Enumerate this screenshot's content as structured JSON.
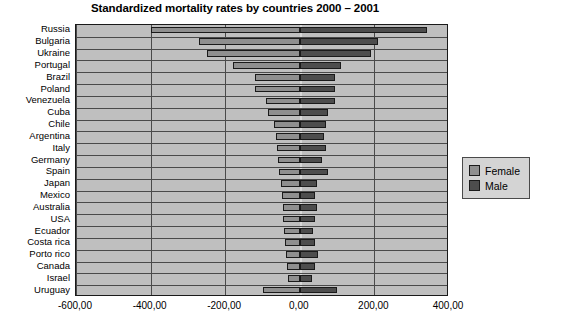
{
  "chart_data": {
    "type": "bar",
    "orientation": "horizontal",
    "style": "diverging-butterfly",
    "title": "Standardized mortality rates by countries 2000 – 2001",
    "xlabel": "",
    "ylabel": "",
    "xlim": [
      -600.0,
      400.0
    ],
    "xticks": [
      -600.0,
      -400.0,
      -200.0,
      0.0,
      200.0,
      400.0
    ],
    "xticklabels": [
      "-600,00",
      "-400,00",
      "-200,00",
      "0,00",
      "200,00",
      "400,00"
    ],
    "grid": true,
    "legend_position": "right-outside",
    "note": "Female values are plotted to the left of zero (negative direction); Male values to the right (positive).",
    "categories": [
      "Russia",
      "Bulgaria",
      "Ukraine",
      "Portugal",
      "Brazil",
      "Poland",
      "Venezuela",
      "Cuba",
      "Chile",
      "Argentina",
      "Italy",
      "Germany",
      "Spain",
      "Japan",
      "Mexico",
      "Australia",
      "USA",
      "Ecuador",
      "Costa rica",
      "Porto rico",
      "Canada",
      "Israel",
      "Uruguay"
    ],
    "series": [
      {
        "name": "Female",
        "color": "#8f8f8f",
        "values": [
          -400,
          -270,
          -250,
          -180,
          -120,
          -120,
          -90,
          -85,
          -70,
          -65,
          -60,
          -58,
          -55,
          -50,
          -48,
          -45,
          -45,
          -42,
          -40,
          -38,
          -35,
          -32,
          -100
        ]
      },
      {
        "name": "Male",
        "color": "#4d4d4d",
        "values": [
          340,
          210,
          190,
          110,
          95,
          95,
          95,
          75,
          70,
          65,
          70,
          60,
          75,
          45,
          40,
          45,
          40,
          35,
          40,
          50,
          40,
          32,
          100
        ]
      }
    ]
  },
  "legend": {
    "items": [
      {
        "label": "Female",
        "color": "#8f8f8f"
      },
      {
        "label": "Male",
        "color": "#4d4d4d"
      }
    ]
  },
  "colors": {
    "plot_background": "#bfbfbf",
    "frame": "#1a1a1a",
    "gridline": "#4a4a4a",
    "zero_line": "#d8d8d8",
    "page_background": "#ffffff"
  }
}
